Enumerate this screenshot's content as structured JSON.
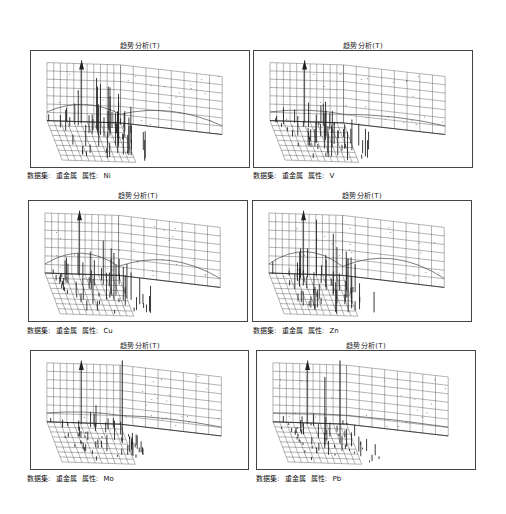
{
  "panels": [
    {
      "title": "趋势分析(T)",
      "dataset_label": "数据集:",
      "dataset": "重金属",
      "attribute_label": "属性:",
      "attribute": "Ni"
    },
    {
      "title": "趋势分析(T)",
      "dataset_label": "数据集:",
      "dataset": "重金属",
      "attribute_label": "属性:",
      "attribute": "V"
    },
    {
      "title": "趋势分析(T)",
      "dataset_label": "数据集:",
      "dataset": "重金属",
      "attribute_label": "属性:",
      "attribute": "Cu"
    },
    {
      "title": "趋势分析(T)",
      "dataset_label": "数据集:",
      "dataset": "重金属",
      "attribute_label": "属性:",
      "attribute": "Zn"
    },
    {
      "title": "趋势分析(T)",
      "dataset_label": "数据集:",
      "dataset": "重金属",
      "attribute_label": "属性:",
      "attribute": "Mo"
    },
    {
      "title": "趋势分析(T)",
      "dataset_label": "数据集:",
      "dataset": "重金属",
      "attribute_label": "属性:",
      "attribute": "Pb"
    }
  ],
  "chart_data": [
    {
      "type": "scatter",
      "title": "趋势分析(T)",
      "subtitle": "数据集: 重金属 属性: Ni",
      "xlabel": "X",
      "ylabel": "Y",
      "zlabel": "Z",
      "grid": true,
      "legend": "none",
      "description": "3D trend analysis: vertical sticks for sample values on XY grid with projected trend curves on back walls; many tall sticks, central peak"
    },
    {
      "type": "scatter",
      "title": "趋势分析(T)",
      "subtitle": "数据集: 重金属 属性: V",
      "xlabel": "X",
      "ylabel": "Y",
      "zlabel": "Z",
      "grid": true,
      "legend": "none",
      "description": "3D trend analysis; moderate sticks, flat-ish trend curves"
    },
    {
      "type": "scatter",
      "title": "趋势分析(T)",
      "subtitle": "数据集: 重金属 属性: Cu",
      "xlabel": "X",
      "ylabel": "Y",
      "zlabel": "Z",
      "grid": true,
      "legend": "none",
      "description": "3D trend analysis; inverted-U trend curves on both walls"
    },
    {
      "type": "scatter",
      "title": "趋势分析(T)",
      "subtitle": "数据集: 重金属 属性: Zn",
      "xlabel": "X",
      "ylabel": "Y",
      "zlabel": "Z",
      "grid": true,
      "legend": "none",
      "description": "3D trend analysis; many tall sticks, inverted-U trend curves"
    },
    {
      "type": "scatter",
      "title": "趋势分析(T)",
      "subtitle": "数据集: 重金属 属性: Mo",
      "xlabel": "X",
      "ylabel": "Y",
      "zlabel": "Z",
      "grid": true,
      "legend": "none",
      "description": "3D trend analysis; mostly short sticks with one tall outlier, low trend curves"
    },
    {
      "type": "scatter",
      "title": "趋势分析(T)",
      "subtitle": "数据集: 重金属 属性: Pb",
      "xlabel": "X",
      "ylabel": "Y",
      "zlabel": "Z",
      "grid": true,
      "legend": "none",
      "description": "3D trend analysis; short sticks with a few tall outliers, flat trend curves"
    }
  ]
}
